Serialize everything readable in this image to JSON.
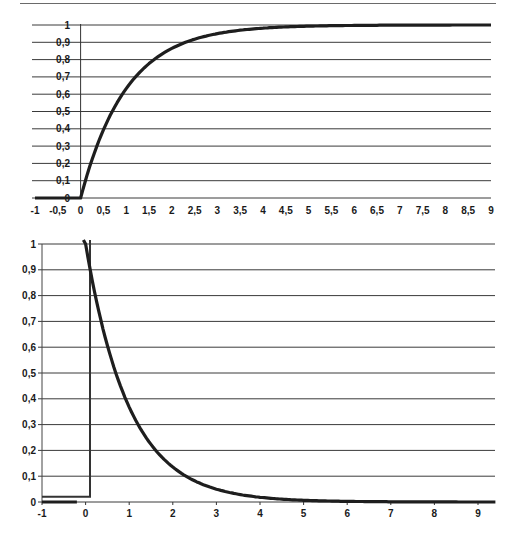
{
  "chart_data": [
    {
      "type": "line",
      "title": "",
      "xlabel": "",
      "ylabel": "",
      "description": "Rising exponential approach 1 - e^(-t), zero for t < 0",
      "xlim": [
        -1,
        9
      ],
      "ylim": [
        0,
        1
      ],
      "grid": "horizontal",
      "legend": "none",
      "x_ticks": [
        "-1",
        "-0,5",
        "0",
        "0,5",
        "1",
        "1,5",
        "2",
        "2,5",
        "3",
        "3,5",
        "4",
        "4,5",
        "5",
        "5,5",
        "6",
        "6,5",
        "7",
        "7,5",
        "8",
        "8,5",
        "9"
      ],
      "y_ticks": [
        "0",
        "0,1",
        "0,2",
        "0,3",
        "0,4",
        "0,5",
        "0,6",
        "0,7",
        "0,8",
        "0,9",
        "1"
      ],
      "x": [
        -1,
        0,
        0.25,
        0.5,
        0.75,
        1,
        1.5,
        2,
        2.5,
        3,
        3.5,
        4,
        5,
        6,
        7,
        8,
        9
      ],
      "series": [
        {
          "name": "response",
          "values": [
            0,
            0,
            0.22,
            0.39,
            0.53,
            0.63,
            0.78,
            0.86,
            0.92,
            0.95,
            0.97,
            0.98,
            0.99,
            1.0,
            1.0,
            1.0,
            1.0
          ]
        }
      ]
    },
    {
      "type": "line",
      "title": "",
      "xlabel": "",
      "ylabel": "",
      "description": "Decaying exponential e^(-t) starting at t = 0 with step from baseline",
      "xlim": [
        -1,
        9.4
      ],
      "ylim": [
        0,
        1
      ],
      "grid": "horizontal",
      "legend": "none",
      "x_ticks": [
        "-1",
        "0",
        "1",
        "2",
        "3",
        "4",
        "5",
        "6",
        "7",
        "8",
        "9"
      ],
      "y_ticks": [
        "0",
        "0,1",
        "0,2",
        "0,3",
        "0,4",
        "0,5",
        "0,6",
        "0,7",
        "0,8",
        "0,9",
        "1"
      ],
      "x": [
        0,
        0.25,
        0.5,
        0.75,
        1,
        1.5,
        2,
        2.5,
        3,
        4,
        5,
        6,
        7,
        8,
        9,
        9.4
      ],
      "series": [
        {
          "name": "decay",
          "values": [
            1.0,
            0.78,
            0.61,
            0.47,
            0.37,
            0.22,
            0.14,
            0.08,
            0.05,
            0.02,
            0.01,
            0.0,
            0.0,
            0.0,
            0.0,
            0.0
          ]
        },
        {
          "name": "step-outline",
          "x": [
            -1,
            0.1,
            0.1
          ],
          "values": [
            0.02,
            0.02,
            1.0
          ]
        }
      ]
    }
  ]
}
